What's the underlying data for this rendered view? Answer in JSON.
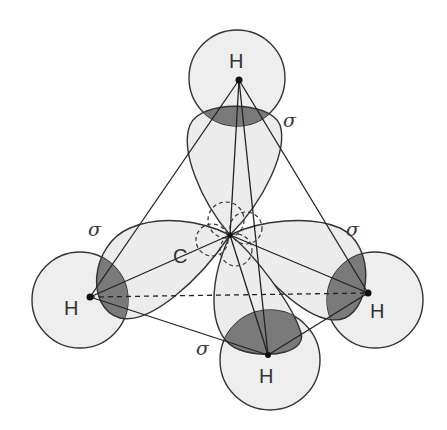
{
  "colors": {
    "background": "#ffffff",
    "orbital_fill": "#ececec",
    "overlap_fill": "#7a7a7a",
    "stroke": "#333333"
  },
  "atoms": {
    "carbon": {
      "label": "C"
    },
    "h_top": {
      "label": "H"
    },
    "h_left": {
      "label": "H"
    },
    "h_right": {
      "label": "H"
    },
    "h_bottom": {
      "label": "H"
    }
  },
  "bond_labels": {
    "top": "σ",
    "left": "σ",
    "right": "σ",
    "bottom": "σ"
  }
}
